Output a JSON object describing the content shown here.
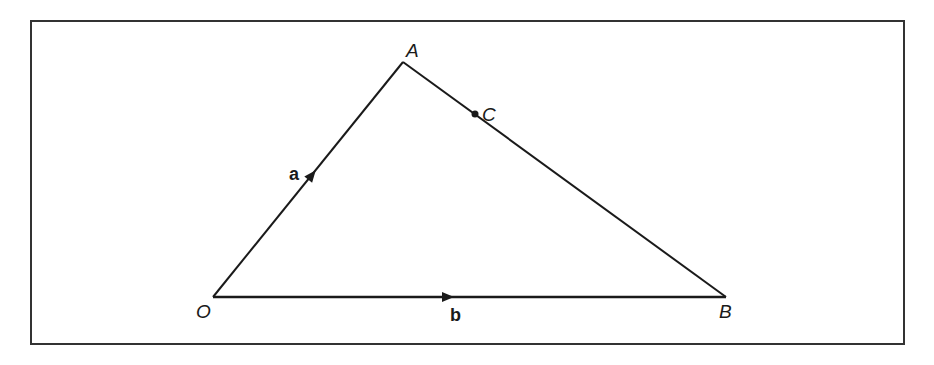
{
  "diagram": {
    "type": "vector-triangle",
    "colors": {
      "stroke": "#1a1a1a",
      "frame": "#333333",
      "background": "#ffffff"
    },
    "frame": {
      "x": 31,
      "y": 21,
      "width": 873,
      "height": 323
    },
    "points": {
      "O": {
        "label": "O",
        "x": 213,
        "y": 297
      },
      "A": {
        "label": "A",
        "x": 403,
        "y": 62
      },
      "B": {
        "label": "B",
        "x": 726,
        "y": 297
      },
      "C": {
        "label": "C",
        "x": 475,
        "y": 114
      }
    },
    "vectors": {
      "a": {
        "label": "a",
        "from": "O",
        "to": "A"
      },
      "b": {
        "label": "b",
        "from": "O",
        "to": "B"
      }
    },
    "segments": [
      {
        "from": "O",
        "to": "A"
      },
      {
        "from": "A",
        "to": "B"
      },
      {
        "from": "O",
        "to": "B"
      }
    ]
  }
}
